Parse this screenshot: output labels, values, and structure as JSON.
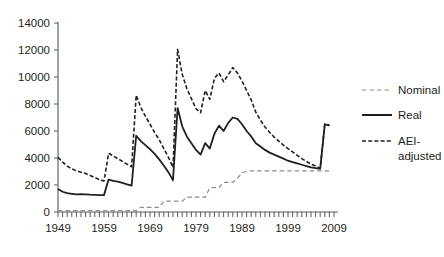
{
  "chart_data": {
    "type": "line",
    "title": "",
    "xlabel": "",
    "ylabel": "",
    "xlim": [
      1949,
      2009
    ],
    "ylim": [
      0,
      14000
    ],
    "grid": false,
    "legend_position": "right",
    "y_ticks": [
      0,
      2000,
      4000,
      6000,
      8000,
      10000,
      12000,
      14000
    ],
    "y_tick_labels": [
      "0",
      "2000",
      "4000",
      "6000",
      "8000",
      "10000",
      "12000",
      "14000"
    ],
    "x_ticks": [
      1949,
      1959,
      1969,
      1979,
      1989,
      1999,
      2009
    ],
    "x_tick_labels": [
      "1949",
      "1959",
      "1969",
      "1979",
      "1989",
      "1999",
      "2009"
    ],
    "x_minor_tick_step": 1,
    "x": [
      1949,
      1950,
      1951,
      1952,
      1953,
      1954,
      1955,
      1956,
      1957,
      1958,
      1959,
      1960,
      1961,
      1962,
      1963,
      1964,
      1965,
      1966,
      1967,
      1968,
      1969,
      1970,
      1971,
      1972,
      1973,
      1974,
      1975,
      1976,
      1977,
      1978,
      1979,
      1980,
      1981,
      1982,
      1983,
      1984,
      1985,
      1986,
      1987,
      1988,
      1989,
      1990,
      1991,
      1992,
      1993,
      1994,
      1995,
      1996,
      1997,
      1998,
      1999,
      2000,
      2001,
      2002,
      2003,
      2004,
      2005,
      2006,
      2007,
      2008
    ],
    "series": [
      {
        "name": "Nominal",
        "style": "dashed",
        "color": "#8d8d8d",
        "width": 1.2,
        "values": [
          100,
          100,
          100,
          100,
          100,
          100,
          100,
          100,
          100,
          100,
          100,
          100,
          100,
          100,
          100,
          100,
          100,
          100,
          350,
          350,
          350,
          350,
          350,
          800,
          800,
          800,
          800,
          800,
          1100,
          1100,
          1100,
          1100,
          1100,
          1800,
          1800,
          1800,
          2200,
          2200,
          2200,
          2500,
          2900,
          3000,
          3050,
          3050,
          3050,
          3050,
          3050,
          3050,
          3050,
          3050,
          3050,
          3050,
          3050,
          3050,
          3050,
          3050,
          3050,
          3050,
          3050,
          3050
        ]
      },
      {
        "name": "Real",
        "style": "solid",
        "color": "#231f20",
        "width": 1.8,
        "values": [
          1700,
          1500,
          1400,
          1350,
          1300,
          1320,
          1300,
          1280,
          1270,
          1250,
          1250,
          2400,
          2300,
          2250,
          2150,
          2050,
          1950,
          5650,
          5250,
          4950,
          4650,
          4300,
          3900,
          3450,
          2950,
          2350,
          7700,
          6350,
          5600,
          5100,
          4600,
          4250,
          5100,
          4700,
          5800,
          6400,
          6000,
          6600,
          7000,
          6900,
          6500,
          6000,
          5600,
          5100,
          4850,
          4600,
          4400,
          4250,
          4100,
          3950,
          3800,
          3700,
          3600,
          3500,
          3400,
          3300,
          3250,
          3200,
          6500,
          6400
        ]
      },
      {
        "name": "AEI-adjusted",
        "style": "dashed",
        "color": "#231f20",
        "width": 1.6,
        "values": [
          4050,
          3700,
          3400,
          3200,
          3050,
          2950,
          2850,
          2700,
          2550,
          2400,
          2300,
          4350,
          4150,
          3950,
          3750,
          3550,
          3350,
          8650,
          7750,
          7100,
          6500,
          5900,
          5350,
          4700,
          4050,
          3300,
          12050,
          10200,
          9150,
          8400,
          7650,
          7350,
          9000,
          8350,
          9900,
          10300,
          9650,
          10150,
          10700,
          10300,
          9700,
          9000,
          8300,
          7400,
          6800,
          6300,
          5900,
          5550,
          5250,
          4950,
          4700,
          4450,
          4200,
          3950,
          3750,
          3550,
          3400,
          3250,
          6500,
          6450
        ]
      }
    ],
    "legend": [
      {
        "label": "Nominal",
        "style": "dashed",
        "color": "#8d8d8d",
        "width": 1.2
      },
      {
        "label": "Real",
        "style": "solid",
        "color": "#231f20",
        "width": 2.0
      },
      {
        "label": "AEI-",
        "label2": "adjusted",
        "style": "dashed",
        "color": "#231f20",
        "width": 1.6
      }
    ]
  },
  "legend": {
    "nominal": "Nominal",
    "real": "Real",
    "aei_line1": "AEI-",
    "aei_line2": "adjusted"
  }
}
